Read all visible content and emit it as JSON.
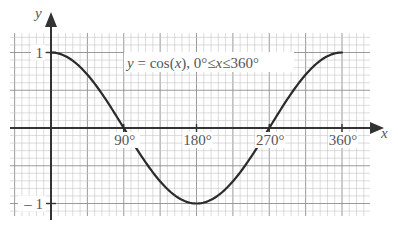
{
  "chart_data": {
    "type": "line",
    "xlabel": "x",
    "ylabel": "y",
    "xlim": [
      -45,
      405
    ],
    "ylim": [
      -1.2,
      1.25
    ],
    "x_ticks": [
      {
        "value": 90,
        "label": "90°"
      },
      {
        "value": 180,
        "label": "180°"
      },
      {
        "value": 270,
        "label": "270°"
      },
      {
        "value": 360,
        "label": "360°"
      }
    ],
    "y_ticks": [
      {
        "value": 1,
        "label": "1"
      },
      {
        "value": -1,
        "label": "– 1"
      }
    ],
    "grid": true,
    "series": [
      {
        "name": "y = cos(x)",
        "x": [
          0,
          30,
          60,
          90,
          120,
          150,
          180,
          210,
          240,
          270,
          300,
          330,
          360
        ],
        "values": [
          1,
          0.866,
          0.5,
          0,
          -0.5,
          -0.866,
          -1,
          -0.866,
          -0.5,
          0,
          0.5,
          0.866,
          1
        ]
      }
    ]
  },
  "colors": {
    "grid_minor": "#c4c4c4",
    "grid_major": "#8f8f8f",
    "axis": "#333333",
    "curve": "#2b2b2b",
    "text": "#555555"
  },
  "labels": {
    "equation_main": "y = cos(x), 0°",
    "leq": "≤",
    "x_var": "x",
    "upper": "360°"
  }
}
